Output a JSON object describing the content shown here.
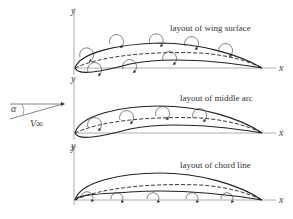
{
  "panels": [
    {
      "title": "layout of wing surface",
      "x_label": "x",
      "y_label": "y"
    },
    {
      "title": "layout of middle arc",
      "x_label": "x",
      "y_label": "y"
    },
    {
      "title": "layout of chord line",
      "x_label": "x",
      "y_label": "y"
    }
  ],
  "inflow": {
    "angle_label": "α",
    "velocity_label": "V∞"
  },
  "colors": {
    "stroke": "#222222",
    "axis": "#999999",
    "text": "#333333"
  }
}
